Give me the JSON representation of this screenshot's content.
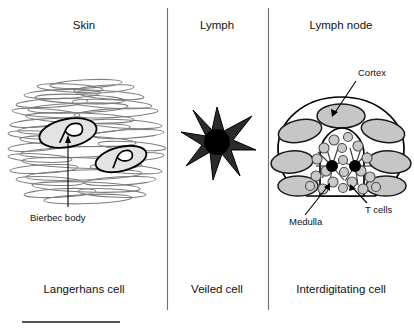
{
  "figure": {
    "width": 414,
    "height": 331,
    "background": "#ffffff"
  },
  "panels": [
    {
      "id": "skin",
      "title": "Skin",
      "caption": "Langerhans cell",
      "title_x": 84,
      "caption_x": 84
    },
    {
      "id": "lymph",
      "title": "Lymph",
      "caption": "Veiled cell",
      "title_x": 217,
      "caption_x": 217
    },
    {
      "id": "lymph-node",
      "title": "Lymph node",
      "caption": "Interdigitating cell",
      "title_x": 341,
      "caption_x": 341
    }
  ],
  "callouts": [
    {
      "id": "birbeck-body",
      "label": "Bierbec body",
      "x": 30,
      "y": 221,
      "anchor": "start"
    },
    {
      "id": "cortex",
      "label": "Cortex",
      "x": 358,
      "y": 76,
      "anchor": "start"
    },
    {
      "id": "medulla",
      "label": "Medulla",
      "x": 289,
      "y": 225,
      "anchor": "start"
    },
    {
      "id": "t-cells",
      "label": "T cells",
      "x": 365,
      "y": 213,
      "anchor": "start"
    }
  ],
  "colors": {
    "keratinocyte_stroke": "#7d7d7d",
    "follicle_fill": "#c6c6c6",
    "tcell_fill": "#c9c9c9",
    "veiled_body": "#2b2b2b",
    "nucleus": "#000000",
    "divider": "#6f6f6f",
    "text": "#111111"
  }
}
